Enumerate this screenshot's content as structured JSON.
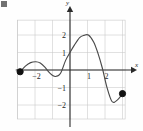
{
  "figure": {
    "corner_mark": "figure-marker",
    "background_color": "#fefefe",
    "curve_color": "#4a4a4a",
    "axis_color": "#2b2b2b",
    "grid_color": "#c8c8c8",
    "endpoint_color": "#111111"
  },
  "axes": {
    "x_axis_label": "x",
    "y_axis_label": "y",
    "x_ticks": [
      {
        "value": -2,
        "label": "−2"
      },
      {
        "value": 1,
        "label": "1"
      },
      {
        "value": 2,
        "label": "2"
      }
    ],
    "y_ticks": [
      {
        "value": 2,
        "label": "2"
      },
      {
        "value": 1,
        "label": "1"
      },
      {
        "value": -1,
        "label": "−1"
      },
      {
        "value": -2,
        "label": "−2"
      }
    ]
  },
  "chart_data": {
    "type": "line",
    "title": "",
    "xlabel": "x",
    "ylabel": "y",
    "xlim": [
      -3.0,
      3.15
    ],
    "ylim": [
      -2.8,
      2.85
    ],
    "grid": true,
    "legend": null,
    "x_tick_values": [
      -2,
      1,
      2
    ],
    "x_tick_labels": [
      "−2",
      "1",
      "2"
    ],
    "y_tick_values": [
      2,
      1,
      -1,
      -2
    ],
    "y_tick_labels": [
      "2",
      "1",
      "−1",
      "−2"
    ],
    "gridline_x": [
      -3,
      -2,
      -1,
      0,
      1,
      2,
      3
    ],
    "gridline_y": [
      -2,
      -1,
      0,
      1,
      2
    ],
    "series": [
      {
        "name": "f(x)",
        "x": [
          -2.85,
          -2.55,
          -2.25,
          -1.95,
          -1.7,
          -1.45,
          -1.15,
          -0.85,
          -0.55,
          -0.25,
          0.0,
          0.25,
          0.55,
          0.8,
          1.05,
          1.35,
          1.6,
          1.85,
          2.1,
          2.4,
          2.7,
          3.0
        ],
        "y": [
          -0.1,
          0.22,
          0.42,
          0.47,
          0.4,
          0.18,
          -0.18,
          -0.37,
          -0.2,
          0.55,
          1.0,
          1.42,
          1.85,
          1.98,
          2.0,
          1.6,
          0.95,
          0.1,
          -0.95,
          -1.8,
          -1.72,
          -1.35
        ]
      }
    ],
    "endpoints": [
      {
        "name": "left-endpoint",
        "x": -2.85,
        "y": -0.1,
        "style": "filled"
      },
      {
        "name": "right-endpoint",
        "x": 3.0,
        "y": -1.35,
        "style": "filled"
      }
    ],
    "annotations": []
  }
}
